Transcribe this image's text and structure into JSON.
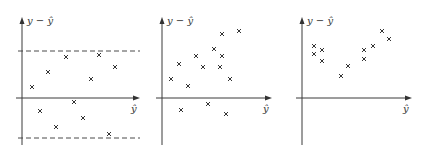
{
  "figure": {
    "panels": [
      {
        "name": "constant-variance",
        "y_label": "y − ŷ",
        "x_label": "ŷ",
        "origin": [
          22,
          98
        ],
        "x_end": 140,
        "y_top": 17,
        "y_bottom": 145,
        "bands": [
          51,
          138
        ],
        "points": [
          [
            32,
            87
          ],
          [
            48,
            72
          ],
          [
            66,
            57
          ],
          [
            99,
            55
          ],
          [
            115,
            67
          ],
          [
            91,
            79
          ],
          [
            74,
            102
          ],
          [
            40,
            111
          ],
          [
            83,
            118
          ],
          [
            56,
            127
          ],
          [
            109,
            134
          ]
        ]
      },
      {
        "name": "non-zero-mean",
        "y_label": "y − ŷ",
        "x_label": "ŷ",
        "origin": [
          162,
          98
        ],
        "x_end": 272,
        "y_top": 17,
        "y_bottom": 145,
        "bands": [],
        "points": [
          [
            171,
            79
          ],
          [
            179,
            64
          ],
          [
            188,
            86
          ],
          [
            196,
            56
          ],
          [
            203,
            67
          ],
          [
            214,
            49
          ],
          [
            220,
            67
          ],
          [
            222,
            56
          ],
          [
            222,
            34
          ],
          [
            230,
            79
          ],
          [
            239,
            31
          ],
          [
            181,
            110
          ],
          [
            208,
            104
          ],
          [
            226,
            114
          ]
        ]
      },
      {
        "name": "nonlinear-pattern",
        "y_label": "y − ŷ",
        "x_label": "ŷ",
        "origin": [
          302,
          98
        ],
        "x_end": 412,
        "y_top": 17,
        "y_bottom": 145,
        "bands": [],
        "points": [
          [
            314,
            46
          ],
          [
            314,
            54
          ],
          [
            322,
            50
          ],
          [
            322,
            61
          ],
          [
            341,
            76
          ],
          [
            348,
            66
          ],
          [
            364,
            50
          ],
          [
            364,
            59
          ],
          [
            373,
            46
          ],
          [
            382,
            31
          ],
          [
            389,
            39
          ]
        ]
      }
    ]
  },
  "chart_data": [
    {
      "type": "scatter",
      "title": "",
      "xlabel": "ŷ",
      "ylabel": "y − ŷ",
      "grid": false,
      "annotations": [
        "horizontal dashed bands above and below the x-axis"
      ],
      "points": [
        [
          32,
          87
        ],
        [
          48,
          72
        ],
        [
          66,
          57
        ],
        [
          99,
          55
        ],
        [
          115,
          67
        ],
        [
          91,
          79
        ],
        [
          74,
          102
        ],
        [
          40,
          111
        ],
        [
          83,
          118
        ],
        [
          56,
          127
        ],
        [
          109,
          134
        ]
      ]
    },
    {
      "type": "scatter",
      "title": "",
      "xlabel": "ŷ",
      "ylabel": "y − ŷ",
      "grid": false,
      "points": [
        [
          171,
          79
        ],
        [
          179,
          64
        ],
        [
          188,
          86
        ],
        [
          196,
          56
        ],
        [
          203,
          67
        ],
        [
          214,
          49
        ],
        [
          220,
          67
        ],
        [
          222,
          56
        ],
        [
          222,
          34
        ],
        [
          230,
          79
        ],
        [
          239,
          31
        ],
        [
          181,
          110
        ],
        [
          208,
          104
        ],
        [
          226,
          114
        ]
      ]
    },
    {
      "type": "scatter",
      "title": "",
      "xlabel": "ŷ",
      "ylabel": "y − ŷ",
      "grid": false,
      "points": [
        [
          314,
          46
        ],
        [
          314,
          54
        ],
        [
          322,
          50
        ],
        [
          322,
          61
        ],
        [
          341,
          76
        ],
        [
          348,
          66
        ],
        [
          364,
          50
        ],
        [
          364,
          59
        ],
        [
          373,
          46
        ],
        [
          382,
          31
        ],
        [
          389,
          39
        ]
      ]
    }
  ]
}
